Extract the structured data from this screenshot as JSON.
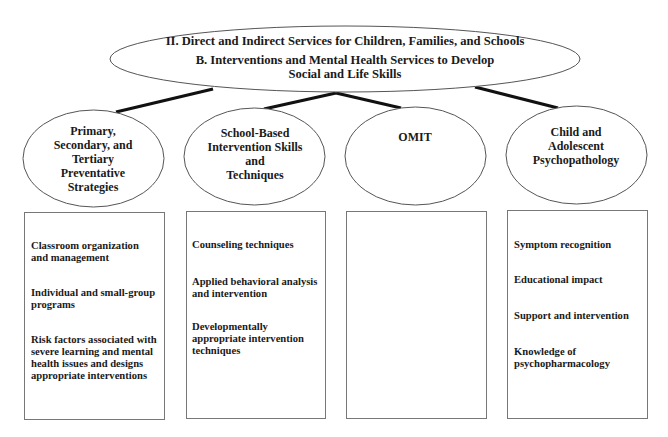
{
  "diagram": {
    "root": {
      "title": "II. Direct and Indirect Services for Children, Families, and Schools",
      "subtitle_line1": "B.  Interventions and Mental Health Services to Develop",
      "subtitle_line2": "Social and Life Skills"
    },
    "nodes": [
      {
        "label_lines": [
          "Primary,",
          "Secondary, and",
          "Tertiary",
          "Preventative",
          "Strategies"
        ],
        "items": [
          "Classroom organization and management",
          "Individual and small-group programs",
          "Risk factors associated with severe learning and mental health issues and designs appropriate interventions"
        ]
      },
      {
        "label_lines": [
          "School-Based",
          "Intervention Skills",
          "and",
          "Techniques"
        ],
        "items": [
          "Counseling techniques",
          "Applied behavioral analysis and intervention",
          "Developmentally appropriate intervention techniques"
        ]
      },
      {
        "label_lines": [
          "OMIT"
        ],
        "items": []
      },
      {
        "label_lines": [
          "Child and",
          "Adolescent",
          "Psychopathology"
        ],
        "items": [
          "Symptom recognition",
          "Educational impact",
          "Support and intervention",
          "Knowledge of psychopharmacology"
        ]
      }
    ],
    "colors": {
      "outline": "#555555",
      "connector": "#111111",
      "text": "#1a1a1a",
      "background": "#ffffff"
    }
  }
}
